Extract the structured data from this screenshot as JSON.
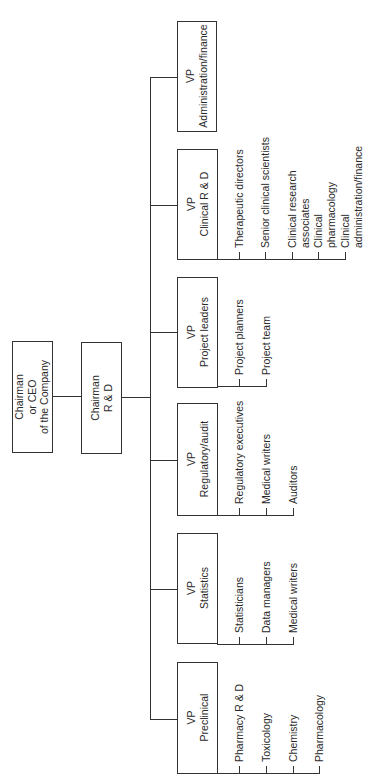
{
  "chart": {
    "ceo": {
      "lines": [
        "Chairman",
        "or CEO",
        "of the Company"
      ]
    },
    "rnd": {
      "lines": [
        "Chairman",
        "R & D"
      ]
    },
    "vps": [
      {
        "id": "admin",
        "lines": [
          "VP",
          "Administration/finance"
        ],
        "reports": []
      },
      {
        "id": "clinical",
        "lines": [
          "VP",
          "Clinical R & D"
        ],
        "reports": [
          {
            "lines": [
              "Therapeutic directors"
            ]
          },
          {
            "lines": [
              "Senior clinical scientists"
            ]
          },
          {
            "lines": [
              "Clinical research",
              "associates"
            ]
          },
          {
            "lines": [
              "Clinical",
              "pharmacology"
            ]
          },
          {
            "lines": [
              "Clinical",
              "administration/finance"
            ]
          }
        ]
      },
      {
        "id": "project",
        "lines": [
          "VP",
          "Project leaders"
        ],
        "reports": [
          {
            "lines": [
              "Project planners"
            ]
          },
          {
            "lines": [
              "Project team"
            ]
          }
        ]
      },
      {
        "id": "regulatory",
        "lines": [
          "VP",
          "Regulatory/audit"
        ],
        "reports": [
          {
            "lines": [
              "Regulatory executives"
            ]
          },
          {
            "lines": [
              "Medical writers"
            ]
          },
          {
            "lines": [
              "Auditors"
            ]
          }
        ]
      },
      {
        "id": "statistics",
        "lines": [
          "VP",
          "Statistics"
        ],
        "reports": [
          {
            "lines": [
              "Statisticians"
            ]
          },
          {
            "lines": [
              "Data managers"
            ]
          },
          {
            "lines": [
              "Medical writers"
            ]
          }
        ]
      },
      {
        "id": "preclinical",
        "lines": [
          "VP",
          "Preclinical"
        ],
        "reports": [
          {
            "lines": [
              "Pharmacy R & D"
            ]
          },
          {
            "lines": [
              "Toxicology"
            ]
          },
          {
            "lines": [
              "Chemistry"
            ]
          },
          {
            "lines": [
              "Pharmacology"
            ]
          }
        ]
      }
    ]
  }
}
